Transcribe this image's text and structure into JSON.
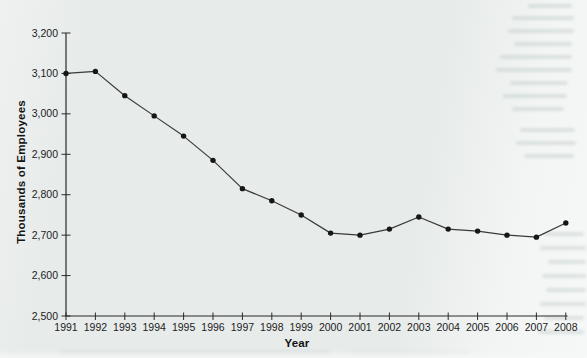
{
  "page": {
    "background": "#e8eceb",
    "paper_highlight": "#f4f6f5"
  },
  "chart_data": {
    "type": "line",
    "title": "",
    "xlabel": "Year",
    "ylabel": "Thousands of Employees",
    "x": [
      1991,
      1992,
      1993,
      1994,
      1995,
      1996,
      1997,
      1998,
      1999,
      2000,
      2001,
      2002,
      2003,
      2004,
      2005,
      2006,
      2007,
      2008
    ],
    "series": [
      {
        "name": "Thousands of Employees",
        "values": [
          3100,
          3105,
          3045,
          2995,
          2945,
          2885,
          2815,
          2785,
          2750,
          2705,
          2700,
          2715,
          2745,
          2715,
          2710,
          2700,
          2695,
          2730
        ],
        "color": "#3a3a3a",
        "marker": "circle",
        "marker_color": "#161616"
      }
    ],
    "ylim": [
      2500,
      3200
    ],
    "yticks": [
      2500,
      2600,
      2700,
      2800,
      2900,
      3000,
      3100,
      3200
    ],
    "ytick_labels": [
      "2,500",
      "2,600",
      "2,700",
      "2,800",
      "2,900",
      "3,000",
      "3,100",
      "3,200"
    ],
    "grid": false,
    "legend": false,
    "axis_color": "#2b2b2b",
    "text_color": "#1c1c1c"
  }
}
